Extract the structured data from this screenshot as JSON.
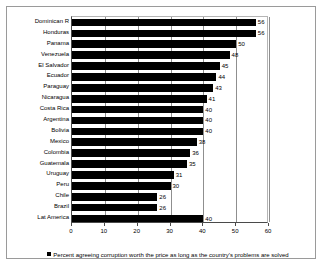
{
  "chart_data": {
    "type": "bar",
    "orientation": "horizontal",
    "title": "",
    "subtitle": "",
    "xlabel": "",
    "ylabel": "",
    "xlim": [
      0,
      60
    ],
    "xticks": [
      0,
      10,
      20,
      30,
      40,
      50,
      60
    ],
    "xtick_labels": [
      "0",
      "10",
      "20",
      "30",
      "40",
      "50",
      "60"
    ],
    "grid": true,
    "grid_axis": "x",
    "legend_position": "bottom",
    "series_color": "#000000",
    "legend": [
      "Percent agreeing corruption worth the price as long as the country's problems are solved"
    ],
    "categories": [
      "Dominican R",
      "Honduras",
      "Panama",
      "Venezuela",
      "El Salvador",
      "Ecuador",
      "Paraguay",
      "Nicaragua",
      "Costa Rica",
      "Argentina",
      "Bolivia",
      "Mexico",
      "Colombia",
      "Guatemala",
      "Uruguay",
      "Peru",
      "Chile",
      "Brazil",
      "Lat America"
    ],
    "values": [
      56,
      56,
      50,
      48,
      45,
      44,
      43,
      41,
      40,
      40,
      40,
      38,
      36,
      35,
      31,
      30,
      26,
      26,
      40
    ],
    "data_labels": [
      "56",
      "56",
      "50",
      "48",
      "45",
      "44",
      "43",
      "41",
      "40",
      "40",
      "40",
      "38",
      "36",
      "35",
      "31",
      "30",
      "26",
      "26",
      "40"
    ]
  },
  "legend": {
    "swatch_icon": "square-swatch-icon"
  }
}
